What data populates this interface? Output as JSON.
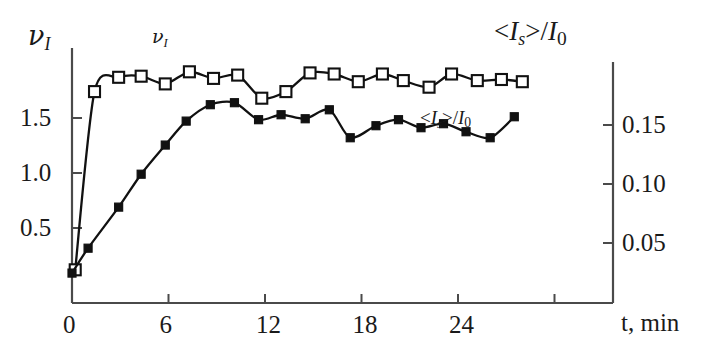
{
  "chart_data": {
    "type": "line",
    "title": "",
    "xlabel": "t, min",
    "x_ticks": [
      0,
      6,
      12,
      18,
      24
    ],
    "x_tick_labels": [
      "0",
      "6",
      "12",
      "18",
      "24"
    ],
    "xlim": [
      0,
      29
    ],
    "grid": false,
    "legend_position": "inline-annotations",
    "left_axis": {
      "label": "ν_I",
      "label_plain": "nu_I",
      "ticks": [
        0.5,
        1.0,
        1.5
      ],
      "tick_labels": [
        "0.5",
        "1.0",
        "1.5"
      ],
      "ylim": [
        0.0,
        2.1
      ]
    },
    "right_axis": {
      "label": "<I_s>/I_0",
      "label_plain": "<Is>/I0",
      "ticks": [
        0.05,
        0.1,
        0.15
      ],
      "tick_labels": [
        "0.05",
        "0.10",
        "0.15"
      ],
      "ylim": [
        -0.0095,
        0.1864
      ]
    },
    "series": [
      {
        "name": "ν_I",
        "axis": "left",
        "marker": "open-square",
        "annotation": "ν_I",
        "x": [
          0.2,
          1.4,
          2.9,
          4.3,
          5.8,
          7.3,
          8.8,
          10.3,
          11.8,
          13.3,
          14.8,
          16.3,
          17.8,
          19.3,
          20.6,
          22.2,
          23.6,
          25.2,
          26.7,
          28.0
        ],
        "y": [
          0.12,
          1.74,
          1.87,
          1.88,
          1.81,
          1.92,
          1.86,
          1.89,
          1.68,
          1.74,
          1.91,
          1.9,
          1.83,
          1.9,
          1.84,
          1.78,
          1.9,
          1.84,
          1.85,
          1.83
        ]
      },
      {
        "name": "<I_s>/I_0",
        "axis": "right",
        "marker": "filled-square",
        "annotation": "<I_s>/I_0",
        "x": [
          0.0,
          1.0,
          2.9,
          4.3,
          5.8,
          7.1,
          8.6,
          10.1,
          11.6,
          13.0,
          14.5,
          16.0,
          17.3,
          18.9,
          20.3,
          21.7,
          23.1,
          24.5,
          26.0,
          27.5
        ],
        "y": [
          0.0245,
          0.0456,
          0.0804,
          0.1083,
          0.133,
          0.1533,
          0.1672,
          0.1689,
          0.1545,
          0.1587,
          0.1553,
          0.1629,
          0.1392,
          0.1494,
          0.1545,
          0.1477,
          0.1511,
          0.1443,
          0.1392,
          0.157
        ]
      }
    ]
  },
  "annotations": {
    "series1_inline": "ν",
    "series1_inline_sub": "I",
    "series2_inline_pre": "<I",
    "series2_inline_sub": "s",
    "series2_inline_post": ">/I",
    "series2_inline_sub0": "0"
  },
  "colors": {
    "axis": "#4a4a4a",
    "curve": "#111111",
    "marker_fill": "#111111",
    "marker_open": "#ffffff",
    "text": "#1a1a1a",
    "background": "#ffffff"
  }
}
